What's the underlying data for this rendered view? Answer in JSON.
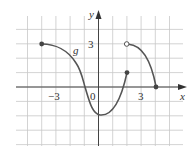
{
  "chart_data": {
    "type": "line",
    "title": "",
    "function_label": "g",
    "xlabel": "x",
    "ylabel": "y",
    "xlim": [
      -6,
      6
    ],
    "ylim": [
      -5,
      5
    ],
    "grid": true,
    "grid_step": 1,
    "x_tick_labels": [
      {
        "value": -3,
        "label": "−3"
      },
      {
        "value": 0,
        "label": "0"
      },
      {
        "value": 3,
        "label": "3"
      }
    ],
    "y_tick_labels": [
      {
        "value": 3,
        "label": "3"
      }
    ],
    "series": [
      {
        "name": "g piece 1",
        "points": [
          [
            -4,
            3
          ],
          [
            -3,
            2.85
          ],
          [
            -2,
            2.1
          ],
          [
            -1,
            0
          ],
          [
            0,
            -2
          ],
          [
            1,
            -1.4
          ],
          [
            2,
            1
          ]
        ],
        "start": {
          "x": -4,
          "y": 3,
          "type": "closed"
        },
        "end": {
          "x": 2,
          "y": 1,
          "type": "closed"
        }
      },
      {
        "name": "g piece 2",
        "points": [
          [
            2,
            3
          ],
          [
            3,
            2.6
          ],
          [
            3.5,
            1.8
          ],
          [
            4,
            0
          ]
        ],
        "start": {
          "x": 2,
          "y": 3,
          "type": "open"
        },
        "end": {
          "x": 4,
          "y": 0,
          "type": "closed"
        }
      }
    ]
  },
  "labels": {
    "function": "g",
    "x_axis": "x",
    "y_axis": "y",
    "x_tick_neg3": "−3",
    "x_tick_0": "0",
    "x_tick_3": "3",
    "y_tick_3": "3"
  },
  "colors": {
    "grid": "#c8c8c8",
    "axis": "#444444",
    "curve": "#555555"
  }
}
